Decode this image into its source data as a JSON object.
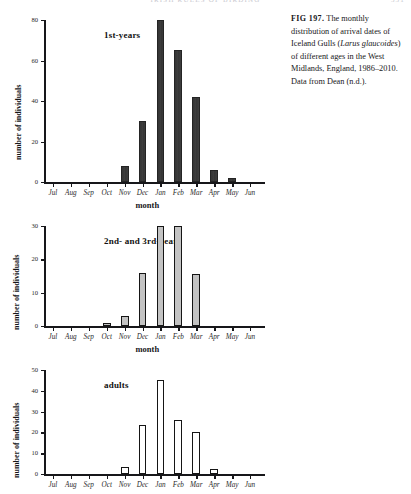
{
  "running_header": {
    "text": "IRISH RULES OF BIRDING",
    "page_number": "331"
  },
  "caption": {
    "fig_label": "FIG 197.",
    "text_part1": " The monthly distribution of arrival dates of Iceland Gulls (",
    "species_italic": "Larus glaucoides",
    "text_part2": ") of different ages in the West Midlands, England, 1986–2010. Data from Dean (n.d.)."
  },
  "chart_data": [
    {
      "id": "chart1",
      "type": "bar",
      "title": "1st-years",
      "xlabel": "month",
      "ylabel": "number of individuals",
      "categories": [
        "Jul",
        "Aug",
        "Sep",
        "Oct",
        "Nov",
        "Dec",
        "Jan",
        "Feb",
        "Mar",
        "Apr",
        "May",
        "Jun"
      ],
      "values": [
        0,
        0,
        0,
        0,
        8,
        30,
        80,
        65,
        42,
        6,
        2,
        0
      ],
      "yticks": [
        0,
        20,
        40,
        60,
        80
      ],
      "ylim": [
        0,
        80
      ],
      "bar_style": "filled",
      "grid": false,
      "legend": "none"
    },
    {
      "id": "chart2",
      "type": "bar",
      "title": "2nd- and 3rd-years",
      "xlabel": "month",
      "ylabel": "number of individuals",
      "categories": [
        "Jul",
        "Aug",
        "Sep",
        "Oct",
        "Nov",
        "Dec",
        "Jan",
        "Feb",
        "Mar",
        "Apr",
        "May",
        "Jun"
      ],
      "values": [
        0,
        0,
        0,
        1,
        3,
        16,
        30,
        30,
        15.5,
        0,
        0,
        0
      ],
      "yticks": [
        0,
        10,
        20,
        30
      ],
      "ylim": [
        0,
        30
      ],
      "bar_style": "grey",
      "grid": false,
      "legend": "none"
    },
    {
      "id": "chart3",
      "type": "bar",
      "title": "adults",
      "xlabel": "",
      "ylabel": "number of individuals",
      "categories": [
        "Jul",
        "Aug",
        "Sep",
        "Oct",
        "Nov",
        "Dec",
        "Jan",
        "Feb",
        "Mar",
        "Apr",
        "May",
        "Jun"
      ],
      "values": [
        0,
        0,
        0,
        0,
        3.5,
        23.5,
        45,
        26,
        20,
        2.5,
        0,
        0
      ],
      "yticks": [
        0,
        10,
        20,
        30,
        40,
        50
      ],
      "ylim": [
        0,
        50
      ],
      "bar_style": "hollow",
      "grid": false,
      "legend": "none"
    }
  ]
}
